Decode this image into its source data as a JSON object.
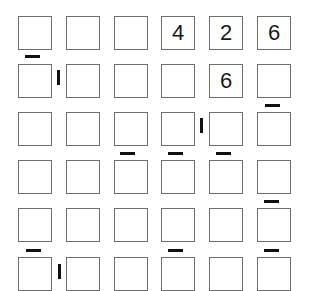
{
  "puzzle": {
    "rows": 6,
    "cols": 6,
    "cells": [
      [
        "",
        "",
        "",
        "4",
        "2",
        "6"
      ],
      [
        "",
        "",
        "",
        "",
        "6",
        ""
      ],
      [
        "",
        "",
        "",
        "",
        "",
        ""
      ],
      [
        "",
        "",
        "",
        "",
        "",
        ""
      ],
      [
        "",
        "",
        "",
        "",
        "",
        ""
      ],
      [
        "",
        "",
        "",
        "",
        "",
        ""
      ]
    ],
    "horizontal_markers_between_rows": [
      {
        "above_row": 1,
        "col": 0
      },
      {
        "above_row": 2,
        "col": 5
      },
      {
        "above_row": 3,
        "col": 2
      },
      {
        "above_row": 3,
        "col": 3
      },
      {
        "above_row": 3,
        "col": 4
      },
      {
        "above_row": 4,
        "col": 5
      },
      {
        "above_row": 5,
        "col": 0
      },
      {
        "above_row": 5,
        "col": 3
      },
      {
        "above_row": 5,
        "col": 5
      }
    ],
    "vertical_markers_between_cols": [
      {
        "row": 1,
        "left_of_col": 1
      },
      {
        "row": 2,
        "left_of_col": 4
      },
      {
        "row": 5,
        "left_of_col": 1
      }
    ]
  }
}
